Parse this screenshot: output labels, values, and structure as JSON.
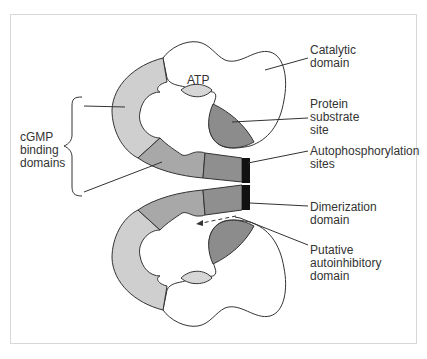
{
  "diagram": {
    "type": "protein-domain-schematic",
    "labels": {
      "atp": "ATP",
      "catalytic_domain": "Catalytic\ndomain",
      "protein_substrate_site": "Protein\nsubstrate\nsite",
      "autophosphorylation_sites": "Autophosphorylation\nsites",
      "dimerization_domain": "Dimerization\ndomain",
      "putative_autoinhibitory_domain": "Putative\nautoinhibitory\ndomain",
      "cgmp_binding_domains": "cGMP\nbinding\ndomains"
    },
    "colors": {
      "frame_border": "#d8d8d8",
      "outline": "#333333",
      "cgmp_domain_a": "#cfcfcf",
      "cgmp_domain_b": "#a8a8a8",
      "autoinhibitory_segment": "#8f8f8f",
      "dimerization_band": "#111111",
      "substrate_site": "#8c8c8c",
      "atp_pocket": "#d6d6d6",
      "catalytic_fill": "#ffffff"
    }
  }
}
